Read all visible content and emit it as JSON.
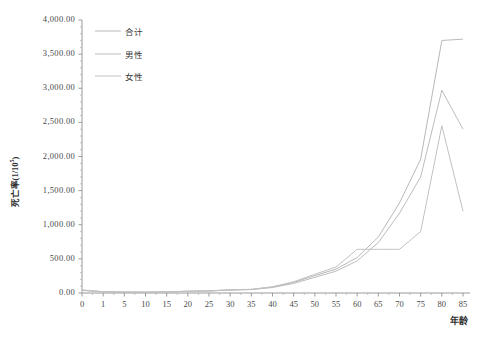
{
  "chart_data": {
    "type": "line",
    "title": "",
    "xlabel": "年龄",
    "ylabel": "死亡率(1/10⁵)",
    "ylabel_base": "死亡率(1/10",
    "ylabel_sup": "5",
    "ylabel_tail": ")",
    "ylim": [
      0,
      4000
    ],
    "ytick_step": 500,
    "grid": false,
    "legend_position": "top-left-inside",
    "ytick_labels": [
      "4,000.00",
      "3,500.00",
      "3,000.00",
      "2,500.00",
      "2,000.00",
      "1,500.00",
      "1,000.00",
      "500.00",
      "0.00"
    ],
    "ytick_values": [
      4000,
      3500,
      3000,
      2500,
      2000,
      1500,
      1000,
      500,
      0
    ],
    "categories": [
      "0",
      "1",
      "5",
      "10",
      "15",
      "20",
      "25",
      "30",
      "35",
      "40",
      "45",
      "50",
      "55",
      "60",
      "65",
      "70",
      "75",
      "80",
      "85"
    ],
    "x": [
      0,
      1,
      5,
      10,
      15,
      20,
      25,
      30,
      35,
      40,
      45,
      50,
      55,
      60,
      65,
      70,
      75,
      80,
      85
    ],
    "series": [
      {
        "name": "合计",
        "color": "#b9b9b9",
        "values": [
          42,
          18,
          14,
          12,
          16,
          26,
          30,
          46,
          52,
          88,
          155,
          255,
          350,
          520,
          820,
          1320,
          1960,
          3700,
          3720
        ]
      },
      {
        "name": "男性",
        "color": "#bdbdbd",
        "values": [
          38,
          16,
          13,
          11,
          15,
          24,
          28,
          42,
          50,
          80,
          140,
          230,
          320,
          470,
          740,
          1170,
          1700,
          2970,
          2400
        ]
      },
      {
        "name": "女性",
        "color": "#c2c2c2",
        "values": [
          45,
          20,
          15,
          13,
          17,
          27,
          32,
          48,
          54,
          92,
          165,
          275,
          380,
          640,
          640,
          640,
          900,
          2450,
          1200
        ]
      }
    ]
  },
  "legend": {
    "items": [
      {
        "label": "合计"
      },
      {
        "label": "男性"
      },
      {
        "label": "女性"
      }
    ]
  },
  "axes": {
    "x_title": "年龄",
    "minor_ticks": true
  }
}
